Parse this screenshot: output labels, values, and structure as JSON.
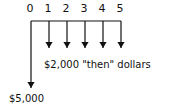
{
  "diagram": {
    "type": "cash-flow-timeline",
    "periods": [
      "0",
      "1",
      "2",
      "3",
      "4",
      "5"
    ],
    "flows": [
      {
        "period": "0",
        "direction": "down",
        "label": "$5,000"
      },
      {
        "period": "1",
        "direction": "down",
        "amount": "$2,000"
      },
      {
        "period": "2",
        "direction": "down",
        "amount": "$2,000"
      },
      {
        "period": "3",
        "direction": "down",
        "amount": "$2,000"
      },
      {
        "period": "4",
        "direction": "down",
        "amount": "$2,000"
      },
      {
        "period": "5",
        "direction": "down",
        "amount": "$2,000"
      }
    ],
    "periodic_label": "$2,000  \"then\" dollars",
    "initial_label": "$5,000",
    "line_color": "#111111"
  }
}
